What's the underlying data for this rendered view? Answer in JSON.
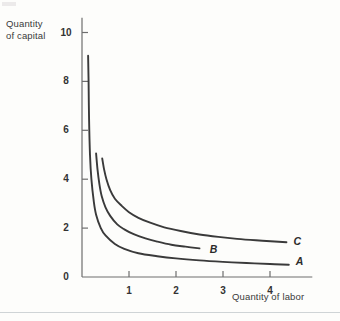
{
  "figure": {
    "background_color": "#fdfdfb",
    "curve_color": "#3a3a3a",
    "axis_color": "#6e6e6e"
  },
  "axes": {
    "y_title_line1": "Quantity",
    "y_title_line2": "of capital",
    "x_title": "Quantity of labor",
    "y_ticks": [
      "10",
      "8",
      "6",
      "4",
      "2"
    ],
    "x_ticks": [
      "1",
      "2",
      "3",
      "4"
    ],
    "origin_label": "0"
  },
  "curve_labels": {
    "a": "A",
    "b": "B",
    "c": "C"
  },
  "chart_data": {
    "type": "line",
    "title": "",
    "xlabel": "Quantity of labor",
    "ylabel": "Quantity of capital",
    "xlim": [
      0,
      4.9
    ],
    "ylim": [
      0,
      10.6
    ],
    "xticks": [
      0,
      1,
      2,
      3,
      4
    ],
    "yticks": [
      0,
      2,
      4,
      6,
      8,
      10
    ],
    "grid": false,
    "legend": "inline-curve-labels",
    "series": [
      {
        "name": "A",
        "label": "A",
        "label_position": [
          4.55,
          0.62
        ],
        "points": [
          [
            0.13,
            9.05
          ],
          [
            0.14,
            8.0
          ],
          [
            0.15,
            6.5
          ],
          [
            0.17,
            5.0
          ],
          [
            0.2,
            4.0
          ],
          [
            0.25,
            3.1
          ],
          [
            0.3,
            2.55
          ],
          [
            0.4,
            2.0
          ],
          [
            0.5,
            1.7
          ],
          [
            0.7,
            1.35
          ],
          [
            0.9,
            1.15
          ],
          [
            1.2,
            0.97
          ],
          [
            1.6,
            0.85
          ],
          [
            2.0,
            0.76
          ],
          [
            2.5,
            0.68
          ],
          [
            3.0,
            0.62
          ],
          [
            3.5,
            0.57
          ],
          [
            4.0,
            0.53
          ],
          [
            4.4,
            0.5
          ]
        ]
      },
      {
        "name": "B",
        "label": "B",
        "label_position": [
          2.72,
          1.12
        ],
        "points": [
          [
            0.3,
            5.05
          ],
          [
            0.33,
            4.4
          ],
          [
            0.37,
            3.8
          ],
          [
            0.42,
            3.3
          ],
          [
            0.5,
            2.85
          ],
          [
            0.6,
            2.5
          ],
          [
            0.75,
            2.15
          ],
          [
            0.9,
            1.95
          ],
          [
            1.1,
            1.75
          ],
          [
            1.35,
            1.58
          ],
          [
            1.6,
            1.45
          ],
          [
            1.9,
            1.32
          ],
          [
            2.2,
            1.24
          ],
          [
            2.5,
            1.17
          ]
        ]
      },
      {
        "name": "C",
        "label": "C",
        "label_position": [
          4.5,
          1.45
        ],
        "points": [
          [
            0.43,
            4.85
          ],
          [
            0.47,
            4.4
          ],
          [
            0.52,
            4.0
          ],
          [
            0.6,
            3.55
          ],
          [
            0.7,
            3.2
          ],
          [
            0.85,
            2.9
          ],
          [
            1.0,
            2.65
          ],
          [
            1.2,
            2.42
          ],
          [
            1.45,
            2.22
          ],
          [
            1.75,
            2.03
          ],
          [
            2.1,
            1.88
          ],
          [
            2.5,
            1.74
          ],
          [
            2.9,
            1.64
          ],
          [
            3.3,
            1.56
          ],
          [
            3.7,
            1.5
          ],
          [
            4.1,
            1.45
          ],
          [
            4.35,
            1.42
          ]
        ]
      }
    ]
  }
}
